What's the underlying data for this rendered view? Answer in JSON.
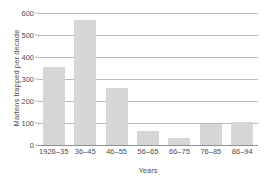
{
  "chart_data": {
    "type": "bar",
    "title": "",
    "xlabel": "Years",
    "ylabel": "Martens trapped per decade",
    "categories": [
      "1926–35",
      "36–45",
      "46–55",
      "56–65",
      "66–75",
      "76–85",
      "86–94"
    ],
    "values": [
      355,
      570,
      260,
      65,
      30,
      95,
      105
    ],
    "ylim": [
      0,
      600
    ],
    "yticks": [
      0,
      100,
      200,
      300,
      400,
      500,
      600
    ],
    "ytick_labels": [
      "0",
      "100",
      "200",
      "300",
      "400",
      "500",
      "600"
    ],
    "grid": true,
    "legend": null,
    "bar_color": "#d6d6d6",
    "axis_color": "#8f8f8f",
    "grid_color": "#b9b9b9",
    "text_color": "#4d4d4d",
    "background": "#ffffff"
  }
}
